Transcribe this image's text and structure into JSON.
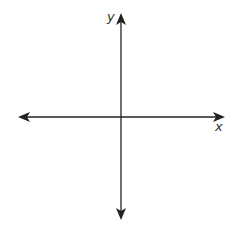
{
  "diagram": {
    "type": "coordinate-axes",
    "x_axis": {
      "label": "x",
      "direction": "bidirectional"
    },
    "y_axis": {
      "label": "y",
      "direction": "bidirectional"
    },
    "colors": {
      "axis": "#222222",
      "label": "#333333",
      "background": "#ffffff"
    }
  }
}
